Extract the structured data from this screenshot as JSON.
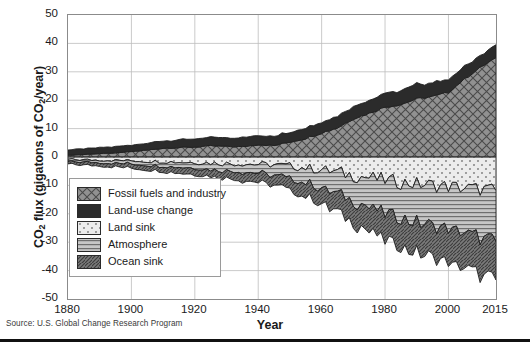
{
  "figure": {
    "source_note": "Source: U.S. Global Change Research Program",
    "ylabel_main": "CO",
    "ylabel_sub1": "2",
    "ylabel_mid": " flux (gigatons of CO",
    "ylabel_sub2": "2",
    "ylabel_end": "/year)",
    "xlabel": "Year"
  },
  "chart_data": {
    "type": "area",
    "title": "",
    "subtitle": "",
    "xlabel": "Year",
    "ylabel": "CO2 flux (gigatons of CO2/year)",
    "xlim": [
      1880,
      2015
    ],
    "ylim": [
      -50,
      50
    ],
    "grid": true,
    "legend_position": "inside-left",
    "stacked": true,
    "xticks": [
      1880,
      1900,
      1920,
      1940,
      1960,
      1980,
      2000,
      2015
    ],
    "xtick_labels": [
      "1880",
      "1900",
      "1920",
      "1940",
      "1960",
      "1980",
      "2000",
      "2015"
    ],
    "yticks": [
      50,
      40,
      30,
      20,
      10,
      0,
      -10,
      -20,
      -30,
      -40,
      -50
    ],
    "ytick_labels": [
      "50",
      "40",
      "30",
      "20",
      "10",
      "0",
      "-10",
      "-20",
      "-30",
      "-40",
      "-50"
    ],
    "x": [
      1880,
      1885,
      1890,
      1895,
      1900,
      1905,
      1910,
      1915,
      1920,
      1925,
      1930,
      1935,
      1940,
      1945,
      1950,
      1955,
      1960,
      1965,
      1970,
      1975,
      1980,
      1985,
      1990,
      1995,
      2000,
      2005,
      2010,
      2015
    ],
    "series": [
      {
        "name": "Fossil fuels and industry",
        "legend_label": "Fossil fuels and industry",
        "pattern": "cross-hatch",
        "color": "#8c8c8c",
        "sign": "positive",
        "values": [
          0.6,
          0.9,
          1.2,
          1.4,
          1.9,
          2.4,
          3.1,
          3.3,
          3.5,
          3.9,
          3.7,
          3.6,
          4.4,
          4.0,
          5.3,
          6.6,
          8.5,
          10.3,
          13.5,
          15.4,
          17.6,
          18.5,
          20.5,
          21.3,
          22.8,
          27.4,
          31.5,
          35.0
        ]
      },
      {
        "name": "Land-use change",
        "legend_label": "Land-use change",
        "pattern": "solid-dark",
        "color": "#2b2b2b",
        "sign": "positive",
        "values": [
          1.9,
          2.0,
          2.1,
          2.2,
          2.3,
          2.5,
          2.6,
          2.7,
          2.8,
          3.0,
          3.1,
          3.2,
          3.3,
          3.4,
          3.6,
          3.8,
          4.0,
          4.2,
          4.5,
          4.7,
          5.0,
          4.9,
          5.1,
          4.8,
          4.6,
          4.4,
          4.3,
          4.5
        ]
      },
      {
        "name": "Land sink",
        "legend_label": "Land sink",
        "pattern": "light-dotted",
        "color": "#e6e6e6",
        "sign": "negative",
        "values": [
          -0.9,
          -1.0,
          -1.1,
          -1.2,
          -1.3,
          -1.5,
          -1.6,
          -1.8,
          -1.9,
          -2.1,
          -2.3,
          -2.4,
          -2.6,
          -2.8,
          -3.2,
          -3.8,
          -4.5,
          -5.4,
          -6.4,
          -7.3,
          -8.2,
          -8.9,
          -9.5,
          -9.9,
          -10.4,
          -10.9,
          -11.4,
          -11.9
        ]
      },
      {
        "name": "Atmosphere",
        "legend_label": "Atmosphere",
        "pattern": "horizontal-lines",
        "color": "#bcbcbc",
        "sign": "negative",
        "values": [
          -0.7,
          -0.8,
          -0.9,
          -1.0,
          -1.1,
          -1.3,
          -1.5,
          -1.7,
          -1.9,
          -2.2,
          -2.5,
          -2.8,
          -3.2,
          -3.6,
          -4.4,
          -5.3,
          -6.4,
          -7.6,
          -9.1,
          -10.4,
          -11.7,
          -12.6,
          -13.6,
          -14.3,
          -15.1,
          -16.0,
          -16.9,
          -17.8
        ]
      },
      {
        "name": "Ocean sink",
        "legend_label": "Ocean sink",
        "pattern": "diagonal-hatch",
        "color": "#6e6e6e",
        "sign": "negative",
        "values": [
          -0.9,
          -1.0,
          -1.1,
          -1.2,
          -1.4,
          -1.6,
          -1.8,
          -2.0,
          -2.2,
          -2.4,
          -2.7,
          -2.9,
          -3.2,
          -3.5,
          -4.1,
          -4.8,
          -5.6,
          -6.5,
          -7.6,
          -8.5,
          -9.4,
          -10.1,
          -10.8,
          -11.3,
          -11.9,
          -12.5,
          -13.1,
          -13.6
        ]
      }
    ]
  }
}
